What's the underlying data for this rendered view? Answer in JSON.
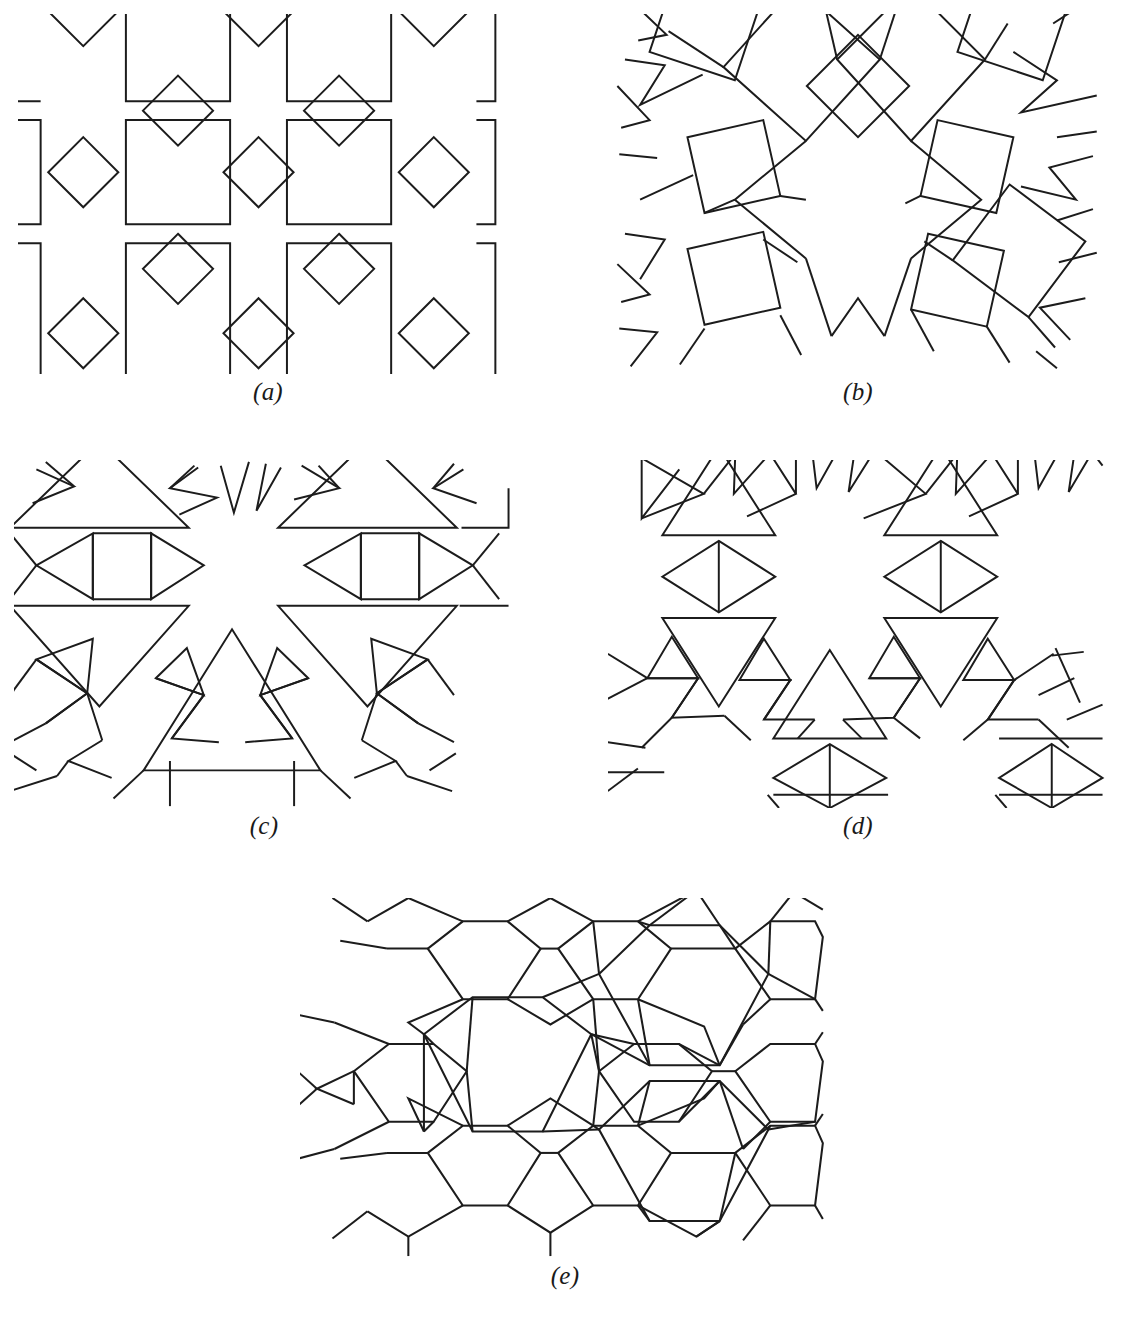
{
  "figure": {
    "type": "geometric-tiling-plate",
    "background_color": "#ffffff",
    "stroke_color": "#1c1c1c",
    "stroke_width_px": 2.1,
    "panel_count": 5,
    "page_width_px": 1127,
    "page_height_px": 1317
  },
  "panels": [
    {
      "id": "a",
      "label": "(a)",
      "description": "Square-and-diamond tiling: grid of large axis-aligned squares linked edge-to-vertex by smaller rotated squares (diamonds), leaving four-pointed star interstices",
      "viewbox": "0 0 520 380",
      "x": 18,
      "y": 14,
      "width": 500,
      "height": 360,
      "label_x": 18,
      "label_y": 378,
      "label_width": 500,
      "motifs": [
        "large-square",
        "diamond",
        "four-point-star-gap"
      ],
      "big_square_side": 110,
      "diamond_half_diagonal": 37,
      "cell_pitch_x": 190,
      "cell_pitch_y": 190
    },
    {
      "id": "b",
      "label": "(b)",
      "description": "Octagonal rosette of tilted squares: large and small squares rotated around a central twelve-pointed star void, with six-pointed star gaps at the edges",
      "viewbox": "0 0 520 380",
      "x": 608,
      "y": 14,
      "width": 500,
      "height": 360,
      "label_x": 608,
      "label_y": 378,
      "label_width": 500,
      "motifs": [
        "tilted-square",
        "star-void",
        "six-point-star-gap"
      ],
      "rotation_order": 6,
      "center_x": 260,
      "center_y": 182
    },
    {
      "id": "c",
      "label": "(c)",
      "description": "Triangle tiling: large upward and downward equilateral triangles with bands of small triangles, forming twelve-pointed star voids",
      "viewbox": "0 0 520 370",
      "x": 14,
      "y": 460,
      "width": 500,
      "height": 348,
      "label_x": 14,
      "label_y": 812,
      "label_width": 500,
      "motifs": [
        "large-triangle-up",
        "large-triangle-down",
        "small-triangle",
        "twelve-point-star-gap"
      ],
      "large_triangle_side": 175,
      "small_triangle_side": 58
    },
    {
      "id": "d",
      "label": "(d)",
      "description": "Triangle-and-rhombus tiling: medium equilateral triangles joined by bowtie rhombi with a bisecting edge, surrounding twelve-pointed star voids",
      "viewbox": "0 0 520 370",
      "x": 608,
      "y": 460,
      "width": 500,
      "height": 348,
      "label_x": 608,
      "label_y": 812,
      "label_width": 500,
      "motifs": [
        "triangle-up",
        "triangle-down",
        "split-rhombus",
        "twelve-point-star-gap"
      ],
      "triangle_side": 120,
      "rhombus_width": 110
    },
    {
      "id": "e",
      "label": "(e)",
      "description": "Hexagon tiling: alternating large and small regular hexagons separated by four-pointed star (bowtie cross) interstices",
      "viewbox": "0 0 500 380",
      "x": 300,
      "y": 898,
      "width": 530,
      "height": 360,
      "label_x": 300,
      "label_y": 1262,
      "label_width": 530,
      "motifs": [
        "large-hexagon",
        "small-hexagon",
        "four-point-star-gap"
      ],
      "large_hexagon_radius": 86,
      "small_hexagon_radius": 50
    }
  ],
  "labels": {
    "a": "(a)",
    "b": "(b)",
    "c": "(c)",
    "d": "(d)",
    "e": "(e)"
  }
}
